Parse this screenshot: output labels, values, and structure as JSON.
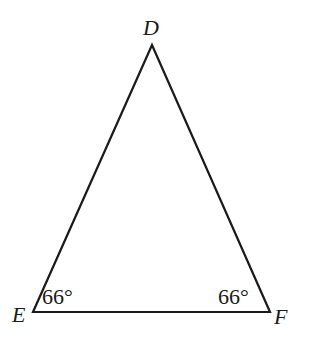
{
  "diagram": {
    "type": "isosceles-triangle",
    "stroke_color": "#1a1a1a",
    "vertices": [
      {
        "name": "D",
        "x": 152,
        "y": 45
      },
      {
        "name": "E",
        "x": 33,
        "y": 312
      },
      {
        "name": "F",
        "x": 270,
        "y": 312
      }
    ],
    "labels": {
      "D": "D",
      "E": "E",
      "F": "F"
    },
    "angles": {
      "E": "66°",
      "F": "66°"
    }
  }
}
